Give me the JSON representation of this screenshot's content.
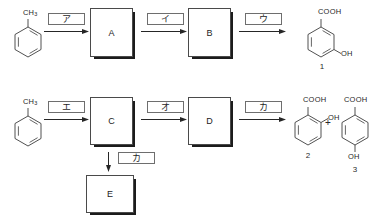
{
  "diagram": {
    "type": "organic-reaction-scheme",
    "stroke_color": "#4a4a4a",
    "shadow_color": "#1c1c1c",
    "text_color": "#1f1f1f"
  },
  "row1": {
    "start": {
      "name": "toluene",
      "substituent": "CH",
      "substituent_sub": "3"
    },
    "steps": [
      {
        "id": "step-a",
        "label": "ア"
      },
      {
        "id": "step-i",
        "label": "イ"
      },
      {
        "id": "step-u",
        "label": "ウ"
      }
    ],
    "boxes": [
      {
        "id": "box-a",
        "label": "A"
      },
      {
        "id": "box-b",
        "label": "B"
      }
    ],
    "product": {
      "name": "3-hydroxybenzoic-acid",
      "top_group": "COOH",
      "side_group": "OH",
      "number": "1"
    }
  },
  "row2": {
    "start": {
      "name": "toluene",
      "substituent": "CH",
      "substituent_sub": "3"
    },
    "steps": [
      {
        "id": "step-e",
        "label": "エ"
      },
      {
        "id": "step-o",
        "label": "オ"
      },
      {
        "id": "step-ka-right",
        "label": "カ"
      }
    ],
    "boxes": [
      {
        "id": "box-c",
        "label": "C"
      },
      {
        "id": "box-d",
        "label": "D"
      }
    ],
    "branch": {
      "id": "step-ka-down",
      "label": "カ",
      "box": {
        "id": "box-e",
        "label": "E"
      }
    },
    "products": [
      {
        "name": "salicylic-acid",
        "top_group": "COOH",
        "side_group": "OH",
        "number": "2"
      },
      {
        "name": "4-hydroxybenzoic-acid",
        "top_group": "COOH",
        "bottom_group": "OH",
        "number": "3"
      }
    ],
    "separator": "+"
  }
}
